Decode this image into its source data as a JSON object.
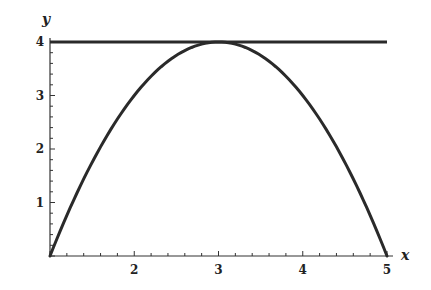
{
  "chart_data": {
    "type": "line",
    "title": "",
    "xlabel": "x",
    "ylabel": "y",
    "xlim": [
      1,
      5
    ],
    "ylim": [
      0,
      4
    ],
    "x_ticks": [
      2,
      3,
      4,
      5
    ],
    "y_ticks": [
      1,
      2,
      3,
      4
    ],
    "grid": false,
    "legend": null,
    "series": [
      {
        "name": "parabola",
        "description": "y = 4 - (x - 3)^2",
        "x": [
          1,
          1.5,
          2,
          2.5,
          3,
          3.5,
          4,
          4.5,
          5
        ],
        "y": [
          0,
          1.75,
          3,
          3.75,
          4,
          3.75,
          3,
          1.75,
          0
        ]
      },
      {
        "name": "horizontal-line",
        "description": "y = 4",
        "x": [
          1,
          5
        ],
        "y": [
          4,
          4
        ]
      }
    ]
  },
  "labels": {
    "x_axis": "x",
    "y_axis": "y",
    "x_tick_labels": [
      "2",
      "3",
      "4",
      "5"
    ],
    "y_tick_labels": [
      "1",
      "2",
      "3",
      "4"
    ]
  }
}
